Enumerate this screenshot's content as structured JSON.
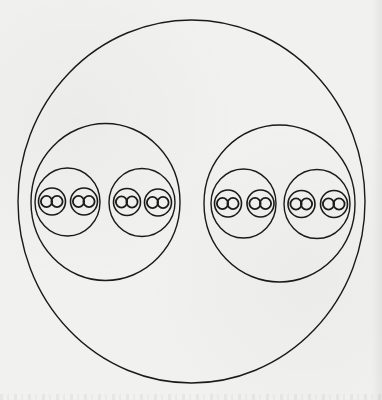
{
  "diagram": {
    "stroke_color": "#1a1a1a",
    "background_color": "#f1f1f0",
    "stroke_width": 1.4,
    "outer": {
      "cx": 191.5,
      "cy": 201.5,
      "rx": 173.5,
      "ry": 181.5
    },
    "groups": [
      {
        "name": "left-group",
        "circle": {
          "cx": 105.5,
          "cy": 202,
          "rx": 74.5,
          "ry": 78.5
        },
        "subgroups": [
          {
            "circle": {
              "cx": 67.5,
              "cy": 202,
              "rx": 32.5,
              "ry": 34
            },
            "units": [
              {
                "cx": 52,
                "cy": 201.5,
                "r": 13.5,
                "inner": [
                  {
                    "cx": 46.5,
                    "cy": 201.5,
                    "r": 5.6
                  },
                  {
                    "cx": 57,
                    "cy": 201.5,
                    "r": 5.6
                  }
                ]
              },
              {
                "cx": 84,
                "cy": 201.5,
                "r": 13.5,
                "inner": [
                  {
                    "cx": 78.5,
                    "cy": 201.5,
                    "r": 5.6
                  },
                  {
                    "cx": 89,
                    "cy": 201.5,
                    "r": 5.6
                  }
                ]
              }
            ]
          },
          {
            "circle": {
              "cx": 142,
              "cy": 202.5,
              "rx": 33,
              "ry": 34
            },
            "units": [
              {
                "cx": 127,
                "cy": 202,
                "r": 13.5,
                "inner": [
                  {
                    "cx": 121.5,
                    "cy": 202,
                    "r": 5.6
                  },
                  {
                    "cx": 132,
                    "cy": 202,
                    "r": 5.6
                  }
                ]
              },
              {
                "cx": 158,
                "cy": 202.5,
                "r": 13.5,
                "inner": [
                  {
                    "cx": 152.5,
                    "cy": 202.5,
                    "r": 5.6
                  },
                  {
                    "cx": 163,
                    "cy": 202.5,
                    "r": 5.6
                  }
                ]
              }
            ]
          }
        ]
      },
      {
        "name": "right-group",
        "circle": {
          "cx": 279.5,
          "cy": 203.5,
          "rx": 75.5,
          "ry": 78.5
        },
        "subgroups": [
          {
            "circle": {
              "cx": 243.5,
              "cy": 203.5,
              "rx": 32.5,
              "ry": 34.5
            },
            "units": [
              {
                "cx": 228,
                "cy": 203.5,
                "r": 13.5,
                "inner": [
                  {
                    "cx": 222.5,
                    "cy": 203.5,
                    "r": 5.6
                  },
                  {
                    "cx": 233,
                    "cy": 203.5,
                    "r": 5.6
                  }
                ]
              },
              {
                "cx": 260.5,
                "cy": 203.5,
                "r": 13.5,
                "inner": [
                  {
                    "cx": 255,
                    "cy": 203.5,
                    "r": 5.6
                  },
                  {
                    "cx": 265.5,
                    "cy": 203.5,
                    "r": 5.6
                  }
                ]
              }
            ]
          },
          {
            "circle": {
              "cx": 317,
              "cy": 204,
              "rx": 33,
              "ry": 34.5
            },
            "units": [
              {
                "cx": 301.5,
                "cy": 204,
                "r": 13.5,
                "inner": [
                  {
                    "cx": 296,
                    "cy": 204,
                    "r": 5.6
                  },
                  {
                    "cx": 306.5,
                    "cy": 204,
                    "r": 5.6
                  }
                ]
              },
              {
                "cx": 334,
                "cy": 204,
                "r": 13.5,
                "inner": [
                  {
                    "cx": 328.5,
                    "cy": 204,
                    "r": 5.6
                  },
                  {
                    "cx": 339,
                    "cy": 204,
                    "r": 5.6
                  }
                ]
              }
            ]
          }
        ]
      }
    ]
  }
}
